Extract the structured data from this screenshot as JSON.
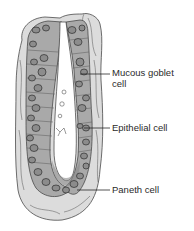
{
  "diagram": {
    "subject": "Intestinal crypt cross-section",
    "colors": {
      "background": "#ffffff",
      "connective_tissue": "#dcdcdc",
      "epithelium": "#a9a9a9",
      "cell_fill": "#8c8c8c",
      "nucleus_outline": "#3a3a3a",
      "paneth_granules": "#7a7a7a",
      "lumen": "#ffffff",
      "outline": "#3a3a3a",
      "text": "#2a2a2a"
    },
    "labels": [
      {
        "id": "mucous-goblet-cell",
        "line1": "Mucous goblet",
        "line2": "cell",
        "line_y": 74,
        "line_x1": 80,
        "line_x2": 110,
        "text_x": 112,
        "text_y": 67
      },
      {
        "id": "epithelial-cell",
        "line1": "Epithelial cell",
        "line2": "",
        "line_y": 128,
        "line_x1": 84,
        "line_x2": 110,
        "text_x": 112,
        "text_y": 122
      },
      {
        "id": "paneth-cell",
        "line1": "Paneth cell",
        "line2": "",
        "line_y": 190,
        "line_x1": 77,
        "line_x2": 110,
        "text_x": 112,
        "text_y": 184
      }
    ]
  }
}
